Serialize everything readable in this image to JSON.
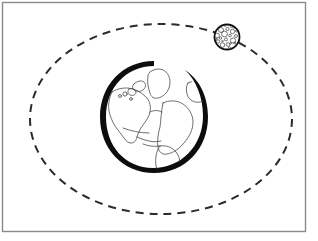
{
  "figure": {
    "canvas": {
      "width": 318,
      "height": 241,
      "background": "#ffffff"
    },
    "frame": {
      "name": "image-border",
      "x": 2.5,
      "y": 2.5,
      "width": 303,
      "height": 229,
      "stroke": "#8a8a8a",
      "stroke_width": 1.4,
      "fill": "none"
    },
    "orbit": {
      "label": "Moon orbital path",
      "shape": "ellipse",
      "cx": 161,
      "cy": 119,
      "rx": 131,
      "ry": 95,
      "stroke": "#2b2b2b",
      "stroke_width": 2.0,
      "dash_pattern": "8 6",
      "fill": "none"
    },
    "earth": {
      "label": "Earth",
      "cx": 154,
      "cy": 117,
      "r": 53,
      "ring_stroke": "#0d0d0d",
      "ring_min_width": 3,
      "ring_max_width": 11,
      "body_fill": "#ffffff",
      "coastline_stroke": "#4a4a4a",
      "coastline_width": 0.8,
      "landmasses": [
        "north-america",
        "greenland",
        "europe",
        "africa",
        "south-america",
        "british-isles",
        "scandinavia",
        "caribbean-arc"
      ]
    },
    "moon": {
      "label": "Moon",
      "cx": 227,
      "cy": 37,
      "r": 12.5,
      "stroke": "#111111",
      "stroke_width": 1.8,
      "fill": "#ffffff",
      "crater_stroke": "#3c3c3c",
      "crater_stroke_width": 0.7,
      "crater_count": 26,
      "craters": [
        {
          "cx": 221.0,
          "cy": 30.0,
          "r": 2.5
        },
        {
          "cx": 227.5,
          "cy": 29.0,
          "r": 1.6
        },
        {
          "cx": 232.5,
          "cy": 31.5,
          "r": 2.2
        },
        {
          "cx": 236.0,
          "cy": 36.0,
          "r": 1.5
        },
        {
          "cx": 233.0,
          "cy": 40.5,
          "r": 2.6
        },
        {
          "cx": 228.0,
          "cy": 44.5,
          "r": 1.8
        },
        {
          "cx": 222.5,
          "cy": 45.0,
          "r": 2.3
        },
        {
          "cx": 218.0,
          "cy": 41.5,
          "r": 1.7
        },
        {
          "cx": 217.0,
          "cy": 35.5,
          "r": 2.4
        },
        {
          "cx": 224.5,
          "cy": 34.0,
          "r": 2.9
        },
        {
          "cx": 230.0,
          "cy": 35.5,
          "r": 1.3
        },
        {
          "cx": 226.0,
          "cy": 39.5,
          "r": 1.5
        },
        {
          "cx": 220.5,
          "cy": 38.0,
          "r": 1.2
        },
        {
          "cx": 231.5,
          "cy": 26.5,
          "r": 1.1
        },
        {
          "cx": 236.5,
          "cy": 31.0,
          "r": 1.0
        },
        {
          "cx": 215.5,
          "cy": 30.0,
          "r": 1.0
        },
        {
          "cx": 219.5,
          "cy": 26.0,
          "r": 1.2
        },
        {
          "cx": 225.0,
          "cy": 25.5,
          "r": 0.9
        },
        {
          "cx": 235.0,
          "cy": 43.0,
          "r": 1.1
        },
        {
          "cx": 229.5,
          "cy": 48.0,
          "r": 1.2
        },
        {
          "cx": 218.0,
          "cy": 47.0,
          "r": 1.0
        },
        {
          "cx": 214.5,
          "cy": 43.5,
          "r": 0.9
        },
        {
          "cx": 222.5,
          "cy": 41.0,
          "r": 0.8
        },
        {
          "cx": 230.5,
          "cy": 43.5,
          "r": 0.8
        },
        {
          "cx": 234.0,
          "cy": 27.5,
          "r": 0.8
        },
        {
          "cx": 216.5,
          "cy": 39.0,
          "r": 0.8
        }
      ]
    }
  }
}
